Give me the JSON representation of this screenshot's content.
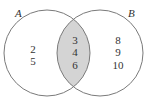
{
  "diagram": {
    "type": "venn",
    "colors": {
      "outline": "#7a7a7a",
      "intersection_fill": "#d4d4d4",
      "background": "#ffffff",
      "text": "#333333"
    },
    "sets": [
      {
        "name": "A",
        "label": "A",
        "only_elements": [
          "2",
          "5"
        ]
      },
      {
        "name": "B",
        "label": "B",
        "only_elements": [
          "8",
          "9",
          "10"
        ]
      }
    ],
    "intersection": {
      "label": "A ∩ B",
      "elements": [
        "3",
        "4",
        "6"
      ],
      "shaded": true
    }
  },
  "labels": {
    "set_a": "A",
    "set_b": "B"
  },
  "regions": {
    "a_only": [
      "2",
      "5"
    ],
    "a_and_b": [
      "3",
      "4",
      "6"
    ],
    "b_only": [
      "8",
      "9",
      "10"
    ]
  }
}
